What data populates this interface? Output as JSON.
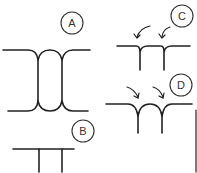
{
  "diagram": {
    "type": "line-drawing",
    "colors": {
      "stroke": "#222222",
      "background": "#ffffff"
    },
    "panels": [
      {
        "id": "A",
        "label": "A",
        "description": "Two vertical lines joined by curved fillets at top and bottom to horizontal lines (H-shaped join)"
      },
      {
        "id": "B",
        "label": "B",
        "description": "Horizontal line with two straight vertical lines descending (sharp T-joints)"
      },
      {
        "id": "C",
        "label": "C",
        "description": "Horizontal line with two vertical lines, curved arrows pointing to inside corners"
      },
      {
        "id": "D",
        "label": "D",
        "description": "Horizontal line with two vertical lines joined by curved fillets, curved arrows pointing toward joints"
      }
    ]
  }
}
